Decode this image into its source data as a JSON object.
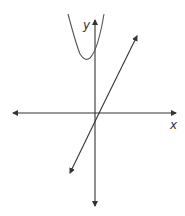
{
  "diagram": {
    "type": "coordinate-graph",
    "axes": {
      "x_label": "x",
      "y_label": "y",
      "color": "#333333"
    },
    "curves": [
      {
        "name": "parabola",
        "description": "Upward-opening parabola with vertex left of y-axis, above x-axis"
      },
      {
        "name": "line",
        "description": "Line with positive slope, negative y-intercept, positive x-intercept, arrows at both ends"
      }
    ]
  }
}
